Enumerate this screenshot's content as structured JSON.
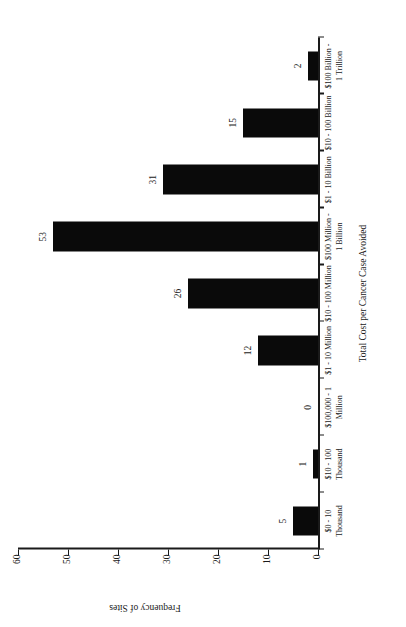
{
  "chart_data": {
    "type": "bar",
    "title": "",
    "subtitle": "",
    "xlabel": "Total Cost per Cancer Case Avoided",
    "ylabel": "Frequency of Sites",
    "categories": [
      "$0 - 10\nThousand",
      "$10 - 100\nThousand",
      "$100,000 - 1\nMillion",
      "$1 - 10 Million",
      "$10 - 100 Million",
      "$100 Million -\n1 Billion",
      "$1 - 10 Billion",
      "$10 - 100 Billion",
      "$100 Billion -\n1 Trillion"
    ],
    "values": [
      5,
      1,
      0,
      12,
      26,
      53,
      31,
      15,
      2
    ],
    "value_labels": [
      "5",
      "1",
      "0",
      "12",
      "26",
      "53",
      "31",
      "15",
      "2"
    ],
    "ylim": [
      0,
      60
    ],
    "yticks": [
      0,
      10,
      20,
      30,
      40,
      50,
      60
    ],
    "ytick_labels": [
      "0",
      "10",
      "20",
      "30",
      "40",
      "50",
      "60"
    ],
    "grid": false,
    "legend": null,
    "bar_color": "#0a0a0a",
    "axis_color": "#1a1a1a",
    "orientation": "vertical",
    "figure_rotation_deg": -90
  }
}
